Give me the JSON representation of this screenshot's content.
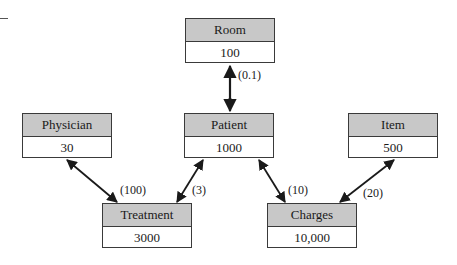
{
  "diagram": {
    "type": "entity-relationship-volume-diagram",
    "entities": {
      "room": {
        "name": "Room",
        "count": "100"
      },
      "physician": {
        "name": "Physician",
        "count": "30"
      },
      "patient": {
        "name": "Patient",
        "count": "1000"
      },
      "item": {
        "name": "Item",
        "count": "500"
      },
      "treatment": {
        "name": "Treatment",
        "count": "3000"
      },
      "charges": {
        "name": "Charges",
        "count": "10,000"
      }
    },
    "relationships": [
      {
        "from": "Room",
        "to": "Patient",
        "label": "(0.1)"
      },
      {
        "from": "Physician",
        "to": "Treatment",
        "label": "(100)"
      },
      {
        "from": "Patient",
        "to": "Treatment",
        "label": "(3)"
      },
      {
        "from": "Patient",
        "to": "Charges",
        "label": "(10)"
      },
      {
        "from": "Item",
        "to": "Charges",
        "label": "(20)"
      }
    ],
    "colors": {
      "header_fill": "#c8c8c8",
      "border": "#3a3a3a",
      "line": "#1a1a1a"
    }
  }
}
